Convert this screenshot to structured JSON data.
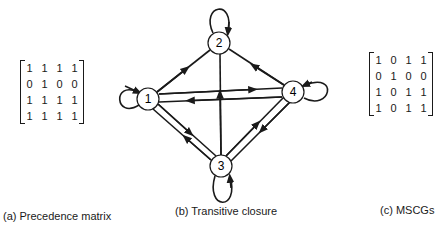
{
  "matrix_a": {
    "caption": "(a)  Precedence matrix",
    "rows": [
      [
        "1",
        "1",
        "1",
        "1"
      ],
      [
        "0",
        "1",
        "0",
        "0"
      ],
      [
        "1",
        "1",
        "1",
        "1"
      ],
      [
        "1",
        "1",
        "1",
        "1"
      ]
    ]
  },
  "graph_b": {
    "caption": "(b)  Transitive closure",
    "nodes": [
      {
        "id": "1",
        "label": "1"
      },
      {
        "id": "2",
        "label": "2"
      },
      {
        "id": "3",
        "label": "3"
      },
      {
        "id": "4",
        "label": "4"
      }
    ],
    "edges": [
      {
        "from": "1",
        "to": "2"
      },
      {
        "from": "4",
        "to": "2"
      },
      {
        "from": "3",
        "to": "2"
      },
      {
        "from": "1",
        "to": "4"
      },
      {
        "from": "4",
        "to": "1"
      },
      {
        "from": "1",
        "to": "3"
      },
      {
        "from": "3",
        "to": "1"
      },
      {
        "from": "3",
        "to": "4"
      },
      {
        "from": "4",
        "to": "3"
      },
      {
        "from": "1",
        "to": "1"
      },
      {
        "from": "2",
        "to": "2"
      },
      {
        "from": "3",
        "to": "3"
      },
      {
        "from": "4",
        "to": "4"
      }
    ]
  },
  "matrix_c": {
    "caption": "(c)  MSCGs",
    "rows": [
      [
        "1",
        "0",
        "1",
        "1"
      ],
      [
        "0",
        "1",
        "0",
        "0"
      ],
      [
        "1",
        "0",
        "1",
        "1"
      ],
      [
        "1",
        "0",
        "1",
        "1"
      ]
    ]
  }
}
